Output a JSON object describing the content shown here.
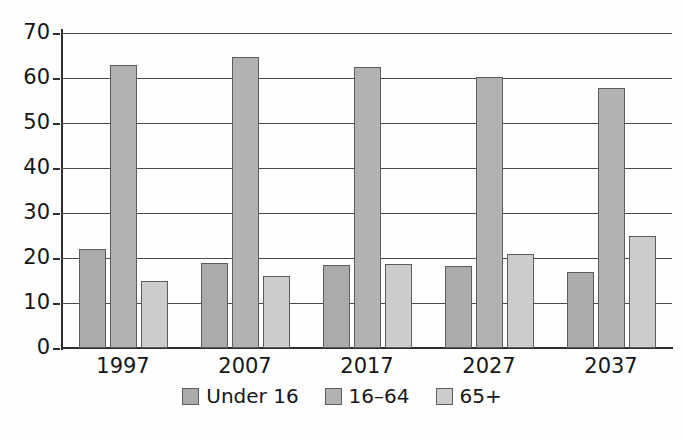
{
  "chart_data": {
    "type": "bar",
    "title": "",
    "subtitle": "",
    "xlabel": "",
    "ylabel": "",
    "categories": [
      "1997",
      "2007",
      "2017",
      "2027",
      "2037"
    ],
    "series": [
      {
        "name": "Under 16",
        "color": "#ababab",
        "values": [
          22.0,
          19.0,
          18.5,
          18.2,
          16.8
        ]
      },
      {
        "name": "16–64",
        "color": "#b2b2b2",
        "values": [
          63.0,
          64.7,
          62.5,
          60.2,
          57.8
        ]
      },
      {
        "name": "65+",
        "color": "#cccccc",
        "values": [
          14.8,
          16.0,
          18.6,
          21.0,
          24.8
        ]
      }
    ],
    "ylim": [
      0,
      70
    ],
    "ytick_step": 10,
    "yticks": [
      "70",
      "60",
      "50",
      "40",
      "30",
      "20",
      "10",
      "0"
    ],
    "grid": true,
    "legend_position": "bottom"
  },
  "axes": {
    "y_tick_labels": [
      "70",
      "60",
      "50",
      "40",
      "30",
      "20",
      "10",
      "0"
    ],
    "x_tick_labels": [
      "1997",
      "2007",
      "2017",
      "2027",
      "2037"
    ]
  },
  "legend": {
    "entries": [
      {
        "label": "Under 16"
      },
      {
        "label": "16–64"
      },
      {
        "label": "65+"
      }
    ]
  }
}
